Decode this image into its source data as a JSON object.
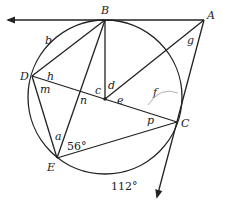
{
  "figure": {
    "type": "circle-geometry",
    "points": {
      "A": "A",
      "B": "B",
      "C": "C",
      "D": "D",
      "E": "E"
    },
    "angle_labels": {
      "a": "a",
      "b": "b",
      "c": "c",
      "d": "d",
      "e": "e",
      "f": "f",
      "g": "g",
      "h": "h",
      "m": "m",
      "n": "n",
      "p": "p"
    },
    "given": {
      "angle_E": "56°",
      "arc_EC": "112°"
    }
  }
}
